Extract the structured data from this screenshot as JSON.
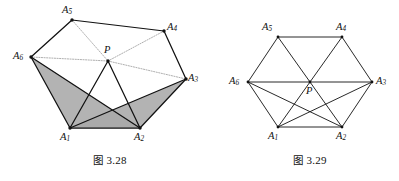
{
  "figures": [
    {
      "id": "fig-3-28",
      "caption_prefix": "图",
      "caption_number": "3.28",
      "caption_full": "图 3.28",
      "description": "Non-convex hexagon A1..A6 with interior point P, shaded triangles",
      "shading_color": "#a9a9a9",
      "line_color": "#111111",
      "dotted_color": "#9a9a9a",
      "vertices": [
        {
          "name": "A1",
          "label": "A",
          "sub": "1",
          "x": 70,
          "y": 128,
          "label_x": 60,
          "label_y": 132
        },
        {
          "name": "A2",
          "label": "A",
          "sub": "2",
          "x": 140,
          "y": 128,
          "label_x": 134,
          "label_y": 132
        },
        {
          "name": "A3",
          "label": "A",
          "sub": "3",
          "x": 186,
          "y": 79,
          "label_x": 188,
          "label_y": 73
        },
        {
          "name": "A4",
          "label": "A",
          "sub": "4",
          "x": 164,
          "y": 31,
          "label_x": 167,
          "label_y": 22
        },
        {
          "name": "A5",
          "label": "A",
          "sub": "5",
          "x": 72,
          "y": 20,
          "label_x": 62,
          "label_y": 5
        },
        {
          "name": "A6",
          "label": "A",
          "sub": "6",
          "x": 31,
          "y": 57,
          "label_x": 13,
          "label_y": 51
        },
        {
          "name": "P",
          "label": "P",
          "sub": "",
          "x": 108,
          "y": 61,
          "label_x": 104,
          "label_y": 45
        }
      ],
      "solid_edges": [
        [
          "A1",
          "A2"
        ],
        [
          "A2",
          "A3"
        ],
        [
          "A3",
          "A4"
        ],
        [
          "A4",
          "A5"
        ],
        [
          "A5",
          "A6"
        ],
        [
          "A6",
          "A1"
        ],
        [
          "A1",
          "P"
        ],
        [
          "A2",
          "P"
        ],
        [
          "A6",
          "A2"
        ],
        [
          "A1",
          "A3"
        ]
      ],
      "dotted_edges": [
        [
          "A6",
          "P"
        ],
        [
          "P",
          "A3"
        ],
        [
          "A5",
          "P"
        ],
        [
          "A4",
          "P"
        ]
      ],
      "shaded_polygons": [
        [
          "A6",
          "A1",
          "A2"
        ],
        [
          "A1",
          "A2",
          "A3"
        ]
      ]
    },
    {
      "id": "fig-3-29",
      "caption_prefix": "图",
      "caption_number": "3.29",
      "caption_full": "图 3.29",
      "description": "Regular hexagon A1..A6 with center P and full diagonal set",
      "shading_color": "none",
      "line_color": "#111111",
      "dotted_color": "#111111",
      "vertices": [
        {
          "name": "A1",
          "label": "A",
          "sub": "1",
          "x": 278,
          "y": 127,
          "label_x": 268,
          "label_y": 131
        },
        {
          "name": "A2",
          "label": "A",
          "sub": "2",
          "x": 342,
          "y": 127,
          "label_x": 336,
          "label_y": 131
        },
        {
          "name": "A3",
          "label": "A",
          "sub": "3",
          "x": 372,
          "y": 82,
          "label_x": 376,
          "label_y": 76
        },
        {
          "name": "A4",
          "label": "A",
          "sub": "4",
          "x": 342,
          "y": 37,
          "label_x": 336,
          "label_y": 22
        },
        {
          "name": "A5",
          "label": "A",
          "sub": "5",
          "x": 278,
          "y": 37,
          "label_x": 262,
          "label_y": 22
        },
        {
          "name": "A6",
          "label": "A",
          "sub": "6",
          "x": 248,
          "y": 82,
          "label_x": 229,
          "label_y": 76
        },
        {
          "name": "P",
          "label": "P",
          "sub": "",
          "x": 310,
          "y": 82,
          "label_x": 306,
          "label_y": 86
        }
      ],
      "solid_edges": [
        [
          "A1",
          "A2"
        ],
        [
          "A2",
          "A3"
        ],
        [
          "A3",
          "A4"
        ],
        [
          "A4",
          "A5"
        ],
        [
          "A5",
          "A6"
        ],
        [
          "A6",
          "A1"
        ],
        [
          "A6",
          "A3"
        ],
        [
          "A1",
          "A4"
        ],
        [
          "A2",
          "A5"
        ],
        [
          "A6",
          "A2"
        ],
        [
          "A1",
          "A3"
        ]
      ],
      "dotted_edges": [],
      "shaded_polygons": []
    }
  ],
  "captions": [
    {
      "id": "caption-3-28",
      "prefix": "图",
      "number": "3.28",
      "x": 93,
      "y": 155
    },
    {
      "id": "caption-3-29",
      "prefix": "图",
      "number": "3.29",
      "x": 293,
      "y": 155
    }
  ],
  "style": {
    "background": "#ffffff",
    "ink": "#111111",
    "shade": "#a9a9a9",
    "faint": "#9a9a9a"
  }
}
